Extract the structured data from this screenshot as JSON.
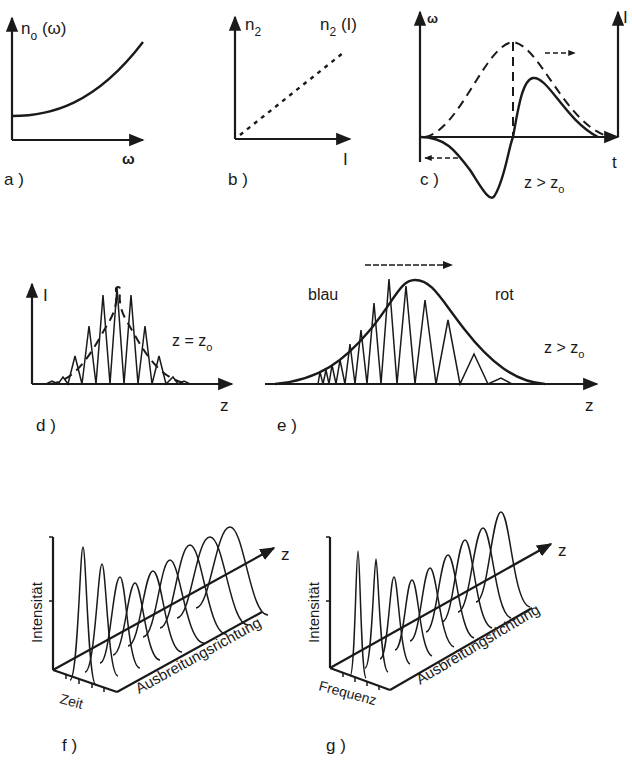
{
  "figure": {
    "panels": [
      {
        "id": "a",
        "label": "a )",
        "y_label": "n",
        "y_label_sub": "o",
        "y_label_suffix": " (ω)",
        "x_label": "ω",
        "curve": "convex rising"
      },
      {
        "id": "b",
        "label": "b )",
        "y_label": "n",
        "y_label_sub": "2",
        "curve_label": "n",
        "curve_label_sub": "2",
        "curve_label_suffix": " (I)",
        "x_label": "I",
        "curve": "linear dotted"
      },
      {
        "id": "c",
        "label": "c )",
        "y_left_label": "ω",
        "y_right_label": "I",
        "x_label": "t",
        "condition": "z > z",
        "condition_sub": "o"
      },
      {
        "id": "d",
        "label": "d )",
        "y_label": "I",
        "x_label": "z",
        "condition": "z = z",
        "condition_sub": "o"
      },
      {
        "id": "e",
        "label": "e )",
        "x_label": "z",
        "left_text": "blau",
        "right_text": "rot",
        "condition": "z > z",
        "condition_sub": "o"
      },
      {
        "id": "f",
        "label": "f )",
        "y_label": "Intensität",
        "x_label": "Zeit",
        "depth_label": "Ausbreitungsrichtung",
        "depth_axis": "z"
      },
      {
        "id": "g",
        "label": "g )",
        "y_label": "Intensität",
        "x_label": "Frequenz",
        "depth_label": "Ausbreitungsrichtung",
        "depth_axis": "z"
      }
    ]
  },
  "colors": {
    "ink": "#1a1a1a",
    "background": "#ffffff"
  }
}
